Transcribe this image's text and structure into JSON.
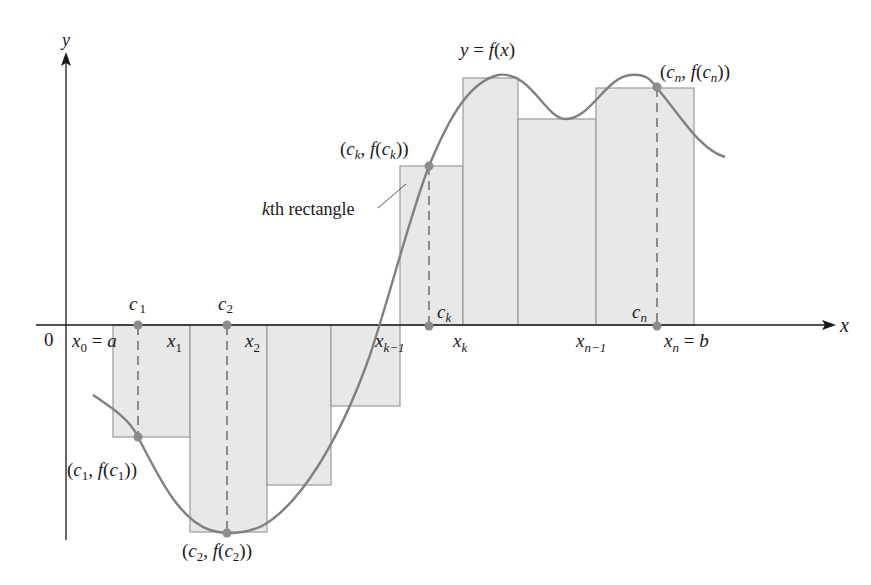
{
  "diagram": {
    "type": "riemann-sum",
    "colors": {
      "rect_fill": "#e8e8e8",
      "rect_stroke": "#9a9a9a",
      "curve": "#808080",
      "axis": "#1a1a1a",
      "point": "#8c8c8c",
      "text": "#1a1a1a"
    },
    "axes": {
      "x_label": "x",
      "y_label": "y",
      "origin_label": "0"
    },
    "curve_label": "y = f(x)",
    "annotation": {
      "text": "kth rectangle",
      "k": "k",
      "rest": "th rectangle"
    },
    "partition_labels": [
      {
        "base": "x",
        "sub": "0",
        "suffix": " = ",
        "tail": "a"
      },
      {
        "base": "x",
        "sub": "1"
      },
      {
        "base": "x",
        "sub": "2"
      },
      {
        "base": "x",
        "sub": "k−1"
      },
      {
        "base": "x",
        "sub": "k"
      },
      {
        "base": "x",
        "sub": "n−1"
      },
      {
        "base": "x",
        "sub": "n",
        "suffix": " = ",
        "tail": "b"
      }
    ],
    "sample_labels": [
      {
        "base": "c",
        "sub": "1"
      },
      {
        "base": "c",
        "sub": "2"
      },
      {
        "base": "c",
        "sub": "k"
      },
      {
        "base": "c",
        "sub": "n"
      }
    ],
    "point_labels": [
      {
        "text": "(c1, f(c1))",
        "sub": "1"
      },
      {
        "text": "(c2, f(c2))",
        "sub": "2"
      },
      {
        "text": "(ck, f(ck))",
        "sub": "k"
      },
      {
        "text": "(cn, f(cn))",
        "sub": "n"
      }
    ],
    "rectangles": [
      {
        "x0": 113,
        "x1": 190,
        "top": 325,
        "bottom": 437
      },
      {
        "x0": 190,
        "x1": 267,
        "top": 325,
        "bottom": 532
      },
      {
        "x0": 267,
        "x1": 331,
        "top": 325,
        "bottom": 485
      },
      {
        "x0": 331,
        "x1": 400,
        "top": 325,
        "bottom": 406
      },
      {
        "x0": 400,
        "x1": 463,
        "top": 166,
        "bottom": 325
      },
      {
        "x0": 463,
        "x1": 518,
        "top": 78,
        "bottom": 325
      },
      {
        "x0": 518,
        "x1": 596,
        "top": 119,
        "bottom": 325
      },
      {
        "x0": 596,
        "x1": 694,
        "top": 88,
        "bottom": 325
      }
    ]
  }
}
